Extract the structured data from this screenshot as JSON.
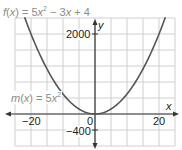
{
  "chart_data": {
    "type": "line",
    "title": "",
    "series": [
      {
        "name": "f(x) = 5x² − 3x + 4",
        "formula": "5x^2 - 3x + 4"
      },
      {
        "name": "m(x) = 5x²",
        "formula": "5x^2"
      }
    ],
    "xlabel": "x",
    "ylabel": "y",
    "x_ticks": [
      -20,
      0,
      20
    ],
    "y_ticks": [
      -400,
      2000
    ],
    "x_grid_step": 5,
    "y_grid_step": 400,
    "xlim": [
      -25,
      25
    ],
    "ylim": [
      -800,
      2400
    ],
    "grid": true,
    "sample_points": {
      "x": [
        -20,
        -15,
        -10,
        -5,
        0,
        5,
        10,
        15,
        20
      ],
      "m": [
        2000,
        1125,
        500,
        125,
        0,
        125,
        500,
        1125,
        2000
      ],
      "f": [
        2064,
        1174,
        534,
        144,
        4,
        114,
        474,
        1084,
        1944
      ]
    }
  },
  "labels": {
    "f_eq_prefix": "f(x) = 5x",
    "f_eq_sup": "2",
    "f_eq_suffix": " − 3x + 4",
    "m_eq_prefix": "m(x) = 5x",
    "m_eq_sup": "2",
    "y_axis": "y",
    "x_axis": "x",
    "tick_2000": "2000",
    "tick_neg400": "−400",
    "tick_0": "0",
    "tick_neg20": "−20",
    "tick_20": "20"
  }
}
